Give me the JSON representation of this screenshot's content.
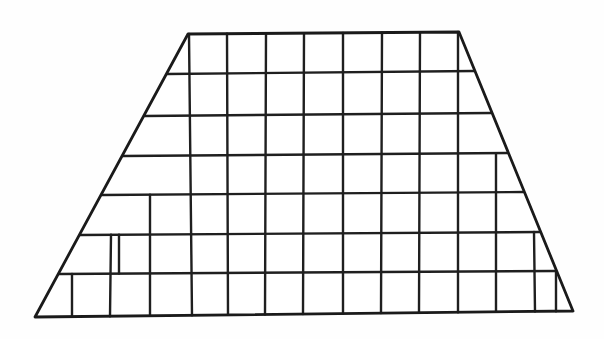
{
  "figure": {
    "shape_name": "trapezoid",
    "background_color": "#fefefe",
    "line_color": "#1f1f1f",
    "outline_color": "#1a1a1a",
    "line_width": 2.4,
    "outline_width": 2.8,
    "canvas": {
      "width": 604,
      "height": 339
    },
    "counts": {
      "horizontal_lines": 8,
      "rows": 7,
      "top_edge_columns": 7,
      "bottom_edge_columns": 14,
      "vertical_lines_total": 15
    },
    "corners": {
      "top_left": {
        "x": 188,
        "y": 34
      },
      "top_right": {
        "x": 459,
        "y": 32
      },
      "bottom_right": {
        "x": 573,
        "y": 311
      },
      "bottom_left": {
        "x": 35,
        "y": 317
      }
    },
    "horizontal_rules": [
      {
        "index": 0,
        "name": "top-edge",
        "y_left": 34,
        "y_right": 32
      },
      {
        "index": 1,
        "name": "rule-1",
        "y_left": 74,
        "y_right": 71
      },
      {
        "index": 2,
        "name": "rule-2",
        "y_left": 116,
        "y_right": 113
      },
      {
        "index": 3,
        "name": "rule-3",
        "y_left": 156,
        "y_right": 153
      },
      {
        "index": 4,
        "name": "rule-4",
        "y_left": 195,
        "y_right": 192
      },
      {
        "index": 5,
        "name": "rule-5",
        "y_left": 235,
        "y_right": 232
      },
      {
        "index": 6,
        "name": "rule-6",
        "y_left": 274,
        "y_right": 271
      },
      {
        "index": 7,
        "name": "bottom-edge",
        "y_left": 317,
        "y_right": 311
      }
    ],
    "vertical_rules": [
      {
        "index": 0,
        "name": "col-0",
        "x_top": 72,
        "x_bottom": 72,
        "start_rule": 6,
        "end_rule": 7
      },
      {
        "index": 1,
        "name": "col-1",
        "x_top": 111,
        "x_bottom": 110,
        "start_rule": 5,
        "end_rule": 7
      },
      {
        "index": 2,
        "name": "col-2",
        "x_top": 150,
        "x_bottom": 150,
        "start_rule": 4,
        "end_rule": 7
      },
      {
        "index": 3,
        "name": "col-3",
        "x_top": 189,
        "x_bottom": 192,
        "start_rule": 0,
        "end_rule": 7
      },
      {
        "index": 4,
        "name": "col-4",
        "x_top": 227,
        "x_bottom": 228,
        "start_rule": 0,
        "end_rule": 7
      },
      {
        "index": 5,
        "name": "col-5",
        "x_top": 266,
        "x_bottom": 265,
        "start_rule": 0,
        "end_rule": 7
      },
      {
        "index": 6,
        "name": "col-6",
        "x_top": 304,
        "x_bottom": 303,
        "start_rule": 0,
        "end_rule": 7
      },
      {
        "index": 7,
        "name": "col-7",
        "x_top": 343,
        "x_bottom": 343,
        "start_rule": 0,
        "end_rule": 7
      },
      {
        "index": 8,
        "name": "col-8",
        "x_top": 382,
        "x_bottom": 381,
        "start_rule": 0,
        "end_rule": 7
      },
      {
        "index": 9,
        "name": "col-9",
        "x_top": 420,
        "x_bottom": 419,
        "start_rule": 0,
        "end_rule": 7
      },
      {
        "index": 10,
        "name": "col-10",
        "x_top": 458,
        "x_bottom": 458,
        "start_rule": 0,
        "end_rule": 7
      },
      {
        "index": 11,
        "name": "col-11",
        "x_top": 496,
        "x_bottom": 496,
        "start_rule": 3,
        "end_rule": 7
      },
      {
        "index": 12,
        "name": "col-12",
        "x_top": 534,
        "x_bottom": 535,
        "start_rule": 5,
        "end_rule": 7
      },
      {
        "index": 13,
        "name": "col-13",
        "x_top": 119,
        "x_bottom": 119,
        "start_rule": 5,
        "end_rule": 6
      },
      {
        "index": 14,
        "name": "col-14",
        "x_top": 556,
        "x_bottom": 556,
        "start_rule": 6,
        "end_rule": 7
      }
    ]
  }
}
